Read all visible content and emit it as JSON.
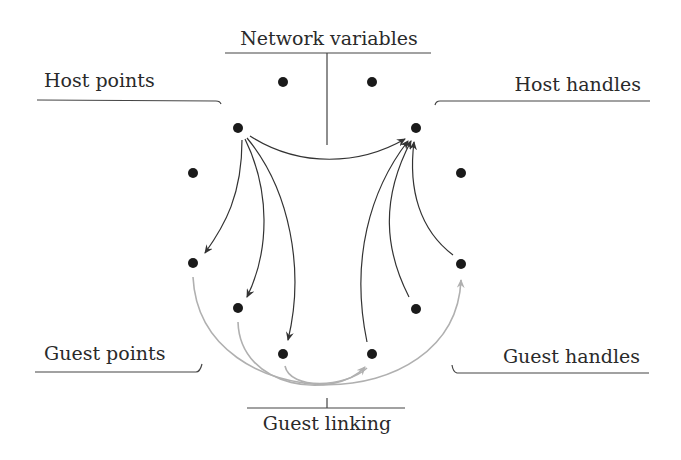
{
  "diagram": {
    "labels": {
      "network_variables": "Network variables",
      "host_points": "Host points",
      "host_handles": "Host handles",
      "guest_points": "Guest points",
      "guest_handles": "Guest handles",
      "guest_linking": "Guest linking"
    },
    "colors": {
      "dot": "#1a1a1a",
      "dark_arrow": "#333333",
      "light_arrow": "#b0b0b0",
      "bracket": "#444444"
    },
    "nodes": [
      {
        "id": "nv1",
        "group": "network-variables",
        "x": 283,
        "y": 82
      },
      {
        "id": "nv2",
        "group": "network-variables",
        "x": 372,
        "y": 82
      },
      {
        "id": "hp1",
        "group": "host-points",
        "x": 238,
        "y": 128
      },
      {
        "id": "hh1",
        "group": "host-handles",
        "x": 416,
        "y": 128
      },
      {
        "id": "hp2",
        "group": "host-points",
        "x": 193,
        "y": 173
      },
      {
        "id": "hh2",
        "group": "host-handles",
        "x": 461,
        "y": 173
      },
      {
        "id": "gp1",
        "group": "guest-points",
        "x": 193,
        "y": 263
      },
      {
        "id": "gh1",
        "group": "guest-handles",
        "x": 461,
        "y": 263
      },
      {
        "id": "gp2",
        "group": "guest-points",
        "x": 238,
        "y": 308
      },
      {
        "id": "gh2",
        "group": "guest-handles",
        "x": 416,
        "y": 308
      },
      {
        "id": "gp3",
        "group": "guest-points",
        "x": 283,
        "y": 354
      },
      {
        "id": "gh3",
        "group": "guest-handles",
        "x": 372,
        "y": 354
      }
    ],
    "edges": [
      {
        "from": "hp1",
        "to": "hh1",
        "style": "dark"
      },
      {
        "from": "hp1",
        "to": "gp1",
        "style": "dark"
      },
      {
        "from": "hp1",
        "to": "gp2",
        "style": "dark"
      },
      {
        "from": "hp1",
        "to": "gp3",
        "style": "dark"
      },
      {
        "from": "gh3",
        "to": "hh1",
        "style": "dark"
      },
      {
        "from": "gh2",
        "to": "hh1",
        "style": "dark"
      },
      {
        "from": "gh1",
        "to": "hh1",
        "style": "dark"
      },
      {
        "from": "gp1",
        "to": "gh1",
        "style": "light"
      },
      {
        "from": "gp2",
        "to": "gh3",
        "style": "light"
      },
      {
        "from": "gp3",
        "to": "gh3",
        "style": "light"
      }
    ]
  }
}
